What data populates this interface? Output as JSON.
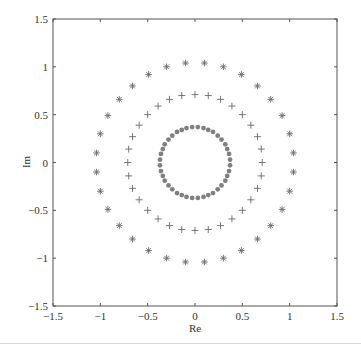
{
  "chart_data": {
    "type": "scatter",
    "title": "",
    "xlabel": "Re",
    "ylabel": "Im",
    "xlim": [
      -1.5,
      1.5
    ],
    "ylim": [
      -1.5,
      1.5
    ],
    "xticks": [
      -1.5,
      -1,
      -0.5,
      0,
      0.5,
      1,
      1.5
    ],
    "yticks": [
      -1.5,
      -1,
      -0.5,
      0,
      0.5,
      1,
      1.5
    ],
    "xtick_labels": [
      "−1.5",
      "−1",
      "−0.5",
      "0",
      "0.5",
      "1",
      "1.5"
    ],
    "ytick_labels": [
      "−1.5",
      "−1",
      "−0.5",
      "0",
      "0.5",
      "1",
      "1.5"
    ],
    "grid": false,
    "legend": null,
    "series": [
      {
        "name": "outer ring",
        "marker": "*",
        "color": "#6a6a6a",
        "radius": 1.04,
        "count": 32,
        "x": [
          1.04,
          1.0,
          0.92,
          0.8,
          0.66,
          0.49,
          0.3,
          0.1,
          -0.1,
          -0.3,
          -0.49,
          -0.66,
          -0.8,
          -0.92,
          -1.0,
          -1.04,
          -1.04,
          -1.0,
          -0.92,
          -0.8,
          -0.66,
          -0.49,
          -0.3,
          -0.1,
          0.1,
          0.3,
          0.49,
          0.66,
          0.8,
          0.92,
          1.0,
          1.04
        ],
        "y": [
          0.1,
          0.3,
          0.49,
          0.66,
          0.8,
          0.92,
          1.0,
          1.04,
          1.04,
          1.0,
          0.92,
          0.8,
          0.66,
          0.49,
          0.3,
          0.1,
          -0.1,
          -0.3,
          -0.49,
          -0.66,
          -0.8,
          -0.92,
          -1.0,
          -1.04,
          -1.04,
          -1.0,
          -0.92,
          -0.8,
          -0.66,
          -0.49,
          -0.3,
          -0.1
        ]
      },
      {
        "name": "middle ring",
        "marker": "+",
        "color": "#6a6a6a",
        "radius": 0.71,
        "count": 32,
        "x": [
          0.71,
          0.7,
          0.66,
          0.59,
          0.5,
          0.39,
          0.27,
          0.14,
          0.0,
          -0.14,
          -0.27,
          -0.39,
          -0.5,
          -0.59,
          -0.66,
          -0.7,
          -0.71,
          -0.7,
          -0.66,
          -0.59,
          -0.5,
          -0.39,
          -0.27,
          -0.14,
          0.0,
          0.14,
          0.27,
          0.39,
          0.5,
          0.59,
          0.66,
          0.7
        ],
        "y": [
          0.0,
          0.14,
          0.27,
          0.39,
          0.5,
          0.59,
          0.66,
          0.7,
          0.71,
          0.7,
          0.66,
          0.59,
          0.5,
          0.39,
          0.27,
          0.14,
          0.0,
          -0.14,
          -0.27,
          -0.39,
          -0.5,
          -0.59,
          -0.66,
          -0.7,
          -0.71,
          -0.7,
          -0.66,
          -0.59,
          -0.5,
          -0.39,
          -0.27,
          -0.14
        ]
      },
      {
        "name": "inner ring",
        "marker": "o",
        "color": "#808080",
        "radius": 0.37,
        "count": 40,
        "x": [
          0.37,
          0.36,
          0.34,
          0.32,
          0.28,
          0.24,
          0.19,
          0.14,
          0.09,
          0.03,
          -0.03,
          -0.09,
          -0.14,
          -0.19,
          -0.24,
          -0.28,
          -0.32,
          -0.34,
          -0.36,
          -0.37,
          -0.37,
          -0.36,
          -0.34,
          -0.32,
          -0.28,
          -0.24,
          -0.19,
          -0.14,
          -0.09,
          -0.03,
          0.03,
          0.09,
          0.14,
          0.19,
          0.24,
          0.28,
          0.32,
          0.34,
          0.36,
          0.37
        ],
        "y": [
          0.03,
          0.09,
          0.14,
          0.19,
          0.24,
          0.28,
          0.32,
          0.34,
          0.36,
          0.37,
          0.37,
          0.36,
          0.34,
          0.32,
          0.28,
          0.24,
          0.19,
          0.14,
          0.09,
          0.03,
          -0.03,
          -0.09,
          -0.14,
          -0.19,
          -0.24,
          -0.28,
          -0.32,
          -0.34,
          -0.36,
          -0.37,
          -0.37,
          -0.36,
          -0.34,
          -0.32,
          -0.28,
          -0.24,
          -0.19,
          -0.14,
          -0.09,
          -0.03
        ]
      }
    ]
  },
  "axes": {
    "xlabel": "Re",
    "ylabel": "Im",
    "frame_color": "#555555"
  }
}
